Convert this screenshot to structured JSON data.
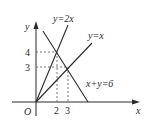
{
  "diagram": {
    "axes": {
      "x_label": "x",
      "y_label": "y",
      "origin_label": "O"
    },
    "ticks": {
      "x": [
        "2",
        "3"
      ],
      "y": [
        "4",
        "3"
      ]
    },
    "lines": [
      {
        "label": "y=2x"
      },
      {
        "label": "y=x"
      },
      {
        "label": "x+y=6"
      }
    ],
    "points": [
      {
        "x": 2,
        "y": 4
      },
      {
        "x": 3,
        "y": 3
      }
    ],
    "colors": {
      "stroke": "#2a2a2a",
      "dashed": "#555555"
    }
  }
}
